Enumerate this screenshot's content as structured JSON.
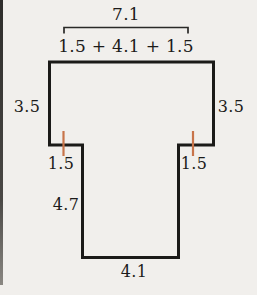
{
  "figure": {
    "labels": {
      "top_total": "7.1",
      "top_sum": "1.5 + 4.1 + 1.5",
      "left_height": "3.5",
      "right_height": "3.5",
      "left_notch": "1.5",
      "right_notch": "1.5",
      "stem_height": "4.7",
      "bottom_width": "4.1"
    },
    "dimensions": {
      "top_total_value": 7.1,
      "top_segments": [
        1.5,
        4.1,
        1.5
      ],
      "side_height_value": 3.5,
      "notch_width_value": 1.5,
      "stem_height_value": 4.7,
      "bottom_width_value": 4.1
    },
    "colors": {
      "outline": "#1b1a18",
      "bracket": "#2a2927",
      "tick_mark": "#c8744a",
      "background": "#f1efec",
      "text": "#1c1b1a",
      "page_edge": "#3a3936"
    }
  }
}
